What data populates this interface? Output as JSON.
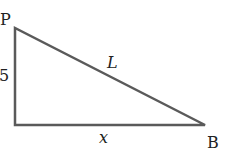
{
  "diagram": {
    "type": "right-triangle",
    "vertices": {
      "top": {
        "label": "P",
        "x": 15,
        "y": 28
      },
      "corner": {
        "label": "",
        "x": 15,
        "y": 125
      },
      "right": {
        "label": "B",
        "x": 205,
        "y": 125
      }
    },
    "labels": {
      "P": "P",
      "B": "B",
      "vertical_side": "5",
      "hypotenuse": "L",
      "base": "x"
    },
    "stroke_color": "#555555",
    "text_color": "#222222"
  }
}
